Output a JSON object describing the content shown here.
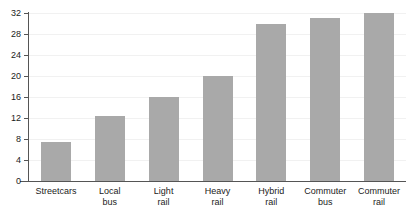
{
  "chart_data": {
    "type": "bar",
    "title": "",
    "subtitle": "",
    "xlabel": "",
    "ylabel": "",
    "categories": [
      "Streetcars",
      "Local bus",
      "Light rail",
      "Heavy rail",
      "Hybrid rail",
      "Commuter bus",
      "Commuter rail"
    ],
    "category_lines": [
      [
        "Streetcars"
      ],
      [
        "Local",
        "bus"
      ],
      [
        "Light",
        "rail"
      ],
      [
        "Heavy",
        "rail"
      ],
      [
        "Hybrid",
        "rail"
      ],
      [
        "Commuter",
        "bus"
      ],
      [
        "Commuter",
        "rail"
      ]
    ],
    "values": [
      7.5,
      12.3,
      16,
      20,
      30,
      31,
      32
    ],
    "ylim": [
      0,
      32
    ],
    "ytick_step": 4,
    "ytick_labels": [
      "0",
      "4",
      "8",
      "12",
      "16",
      "20",
      "24",
      "28",
      "32"
    ],
    "ytick_values": [
      0,
      4,
      8,
      12,
      16,
      20,
      24,
      28,
      32
    ],
    "grid": true,
    "legend": false,
    "legend_position": "none",
    "bar_color": "#a9a9a9",
    "gridline_color": "#f1f1f1",
    "axis_color": "#555555",
    "background_color": "#ffffff",
    "text_color": "#1b1b1b"
  },
  "title_remnant": ""
}
